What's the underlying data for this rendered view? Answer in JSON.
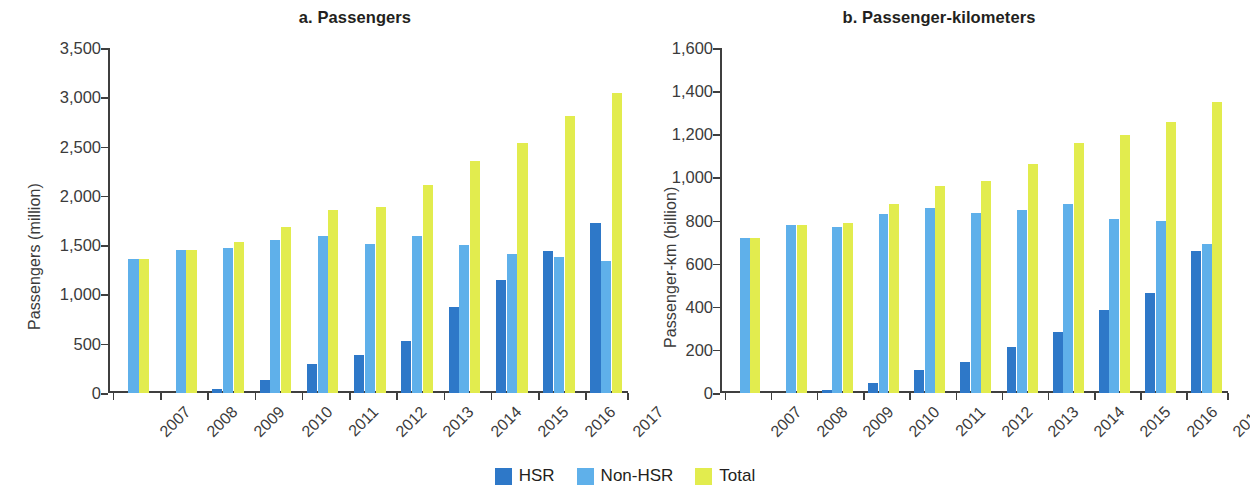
{
  "legend": {
    "items": [
      {
        "label": "HSR",
        "color": "#2e78c8"
      },
      {
        "label": "Non-HSR",
        "color": "#5fb0ea"
      },
      {
        "label": "Total",
        "color": "#e2ec4e"
      }
    ]
  },
  "colors": {
    "hsr": "#2e78c8",
    "non_hsr": "#5fb0ea",
    "total": "#e2ec4e",
    "axis": "#3f3f3f",
    "text": "#231f20"
  },
  "chart_data": [
    {
      "type": "bar",
      "title": "a. Passengers",
      "xlabel": "",
      "ylabel": "Passengers (million)",
      "categories": [
        "2007",
        "2008",
        "2009",
        "2010",
        "2011",
        "2012",
        "2013",
        "2014",
        "2015",
        "2016",
        "2017"
      ],
      "ylim": [
        0,
        3500
      ],
      "yticks": [
        0,
        500,
        1000,
        1500,
        2000,
        2500,
        3000,
        3500
      ],
      "ytick_labels": [
        "0",
        "500",
        "1,000",
        "1,500",
        "2,000",
        "2,500",
        "3,000",
        "3,500"
      ],
      "grid": false,
      "legend_position": "bottom",
      "series": [
        {
          "name": "HSR",
          "color": "#2e78c8",
          "values": [
            0,
            0,
            36,
            133,
            294,
            389,
            530,
            875,
            1150,
            1443,
            1726
          ]
        },
        {
          "name": "Non-HSR",
          "color": "#5fb0ea",
          "values": [
            1357,
            1450,
            1470,
            1550,
            1590,
            1510,
            1590,
            1500,
            1410,
            1382,
            1343
          ]
        },
        {
          "name": "Total",
          "color": "#e2ec4e",
          "values": [
            1357,
            1450,
            1527,
            1683,
            1860,
            1890,
            2106,
            2357,
            2535,
            2814,
            3046
          ]
        }
      ]
    },
    {
      "type": "bar",
      "title": "b. Passenger-kilometers",
      "xlabel": "",
      "ylabel": "Passenger-km (billion)",
      "categories": [
        "2007",
        "2008",
        "2009",
        "2010",
        "2011",
        "2012",
        "2013",
        "2014",
        "2015",
        "2016",
        "2017"
      ],
      "ylim": [
        0,
        1600
      ],
      "yticks": [
        0,
        200,
        400,
        600,
        800,
        1000,
        1200,
        1400,
        1600
      ],
      "ytick_labels": [
        "0",
        "200",
        "400",
        "600",
        "800",
        "1,000",
        "1,200",
        "1,400",
        "1,600"
      ],
      "grid": false,
      "legend_position": "bottom",
      "series": [
        {
          "name": "HSR",
          "color": "#2e78c8",
          "values": [
            0,
            0,
            16,
            46,
            106,
            145,
            214,
            282,
            387,
            465,
            660
          ]
        },
        {
          "name": "Non-HSR",
          "color": "#5fb0ea",
          "values": [
            721,
            778,
            772,
            830,
            856,
            836,
            847,
            878,
            809,
            796,
            691
          ]
        },
        {
          "name": "Total",
          "color": "#e2ec4e",
          "values": [
            721,
            778,
            788,
            876,
            961,
            981,
            1061,
            1160,
            1196,
            1257,
            1351
          ]
        }
      ]
    }
  ]
}
